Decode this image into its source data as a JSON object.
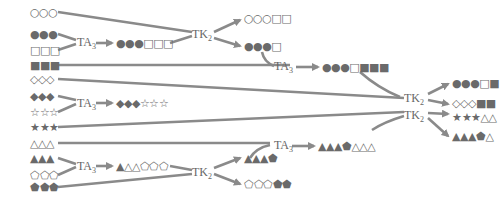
{
  "diagram": {
    "type": "reaction-pathway",
    "colors": {
      "arrow": "#8a8a8a",
      "shape_fill": "#6e6e6e",
      "shape_outline": "#6e6e6e",
      "text": "#666666"
    },
    "inputs": [
      {
        "id": "in1",
        "glyphs": "○○○"
      },
      {
        "id": "in2",
        "glyphs": "●●●"
      },
      {
        "id": "in3",
        "glyphs": "□□□"
      },
      {
        "id": "in4",
        "glyphs": "■■■"
      },
      {
        "id": "in5",
        "glyphs": "◇◇◇"
      },
      {
        "id": "in6",
        "glyphs": "◆◆◆"
      },
      {
        "id": "in7",
        "glyphs": "☆☆☆"
      },
      {
        "id": "in8",
        "glyphs": "★★★"
      },
      {
        "id": "in9",
        "glyphs": "△△△"
      },
      {
        "id": "in10",
        "glyphs": "▲▲▲"
      },
      {
        "id": "in11",
        "glyphs": "⬠⬠⬠"
      },
      {
        "id": "in12",
        "glyphs": "⬟⬟⬟"
      }
    ],
    "enzymes": [
      {
        "id": "ta1",
        "label": "TA",
        "sub": "3"
      },
      {
        "id": "tk1",
        "label": "TK",
        "sub": "2"
      },
      {
        "id": "ta2",
        "label": "TA",
        "sub": "3"
      },
      {
        "id": "ta3",
        "label": "TA",
        "sub": "3"
      },
      {
        "id": "tk2",
        "label": "TK",
        "sub": "2"
      },
      {
        "id": "ta4",
        "label": "TA",
        "sub": "3"
      },
      {
        "id": "tk3",
        "label": "TK",
        "sub": "2"
      },
      {
        "id": "tk4",
        "label": "TK",
        "sub": "2"
      }
    ],
    "intermediates": [
      {
        "id": "p1",
        "glyphs": "●●●□□□"
      },
      {
        "id": "p2",
        "glyphs": "○○○□□"
      },
      {
        "id": "p3",
        "glyphs": "●●●□"
      },
      {
        "id": "p4",
        "glyphs": "●●●□■■■"
      },
      {
        "id": "p5",
        "glyphs": "◆◆◆☆☆☆"
      },
      {
        "id": "p6",
        "glyphs": "▲△△⬠⬠⬠"
      },
      {
        "id": "p7",
        "glyphs": "▲▲▲⬟"
      },
      {
        "id": "p8",
        "glyphs": "⬠⬠⬠⬟⬟"
      },
      {
        "id": "p9",
        "glyphs": "▲▲▲⬟△△△"
      }
    ],
    "outputs": [
      {
        "id": "o1",
        "glyphs": "●●●□■"
      },
      {
        "id": "o2",
        "glyphs": "◇◇◇■■"
      },
      {
        "id": "o3",
        "glyphs": "★★★△△"
      },
      {
        "id": "o4",
        "glyphs": "▲▲▲⬟△"
      }
    ]
  }
}
